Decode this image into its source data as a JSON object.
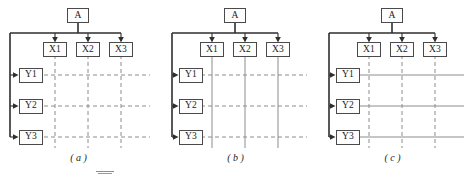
{
  "figure": {
    "width": 471,
    "height": 174,
    "background": "#ffffff",
    "line_color": "#4a4a4a",
    "trunk_color": "#2e2e2e",
    "grid_color": "#8c8c8c"
  },
  "panels": [
    {
      "id": "panel-a",
      "caption": "( a )",
      "caption_letter": "a",
      "root": {
        "label": "A"
      },
      "x_nodes": [
        {
          "label": "X1"
        },
        {
          "label": "X2"
        },
        {
          "label": "X3"
        }
      ],
      "y_nodes": [
        {
          "label": "Y1"
        },
        {
          "label": "Y2"
        },
        {
          "label": "Y3"
        }
      ],
      "grid": {
        "vertical_style": "dashed",
        "horizontal_style": "dashed"
      }
    },
    {
      "id": "panel-b",
      "caption": "( b )",
      "caption_letter": "b",
      "root": {
        "label": "A"
      },
      "x_nodes": [
        {
          "label": "X1"
        },
        {
          "label": "X2"
        },
        {
          "label": "X3"
        }
      ],
      "y_nodes": [
        {
          "label": "Y1"
        },
        {
          "label": "Y2"
        },
        {
          "label": "Y3"
        }
      ],
      "grid": {
        "vertical_style": "solid",
        "horizontal_style": "dashed"
      }
    },
    {
      "id": "panel-c",
      "caption": "( c )",
      "caption_letter": "c",
      "root": {
        "label": "A"
      },
      "x_nodes": [
        {
          "label": "X1"
        },
        {
          "label": "X2"
        },
        {
          "label": "X3"
        }
      ],
      "y_nodes": [
        {
          "label": "Y1"
        },
        {
          "label": "Y2"
        },
        {
          "label": "Y3"
        }
      ],
      "grid": {
        "vertical_style": "dashed",
        "horizontal_style": "solid"
      }
    }
  ]
}
